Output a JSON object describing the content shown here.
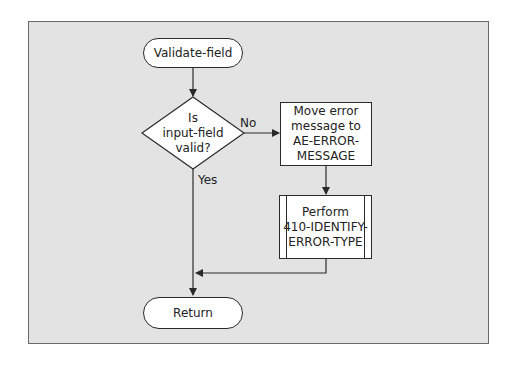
{
  "diagram": {
    "type": "flowchart",
    "colors": {
      "panel_bg": "#e3e3e3",
      "node_fill": "#ffffff",
      "stroke": "#2a2a2a"
    },
    "nodes": {
      "start": {
        "shape": "terminal",
        "label": "Validate-field"
      },
      "decision": {
        "shape": "diamond",
        "line1": "Is",
        "line2": "input-field",
        "line3": "valid?"
      },
      "move": {
        "shape": "process",
        "line1": "Move error",
        "line2": "message to",
        "line3": "AE-ERROR-",
        "line4": "MESSAGE"
      },
      "perform": {
        "shape": "predefined-process",
        "line1": "Perform",
        "line2": "410-IDENTIFY-",
        "line3": "ERROR-TYPE"
      },
      "end": {
        "shape": "terminal",
        "label": "Return"
      }
    },
    "edges": {
      "no_label": "No",
      "yes_label": "Yes"
    }
  }
}
